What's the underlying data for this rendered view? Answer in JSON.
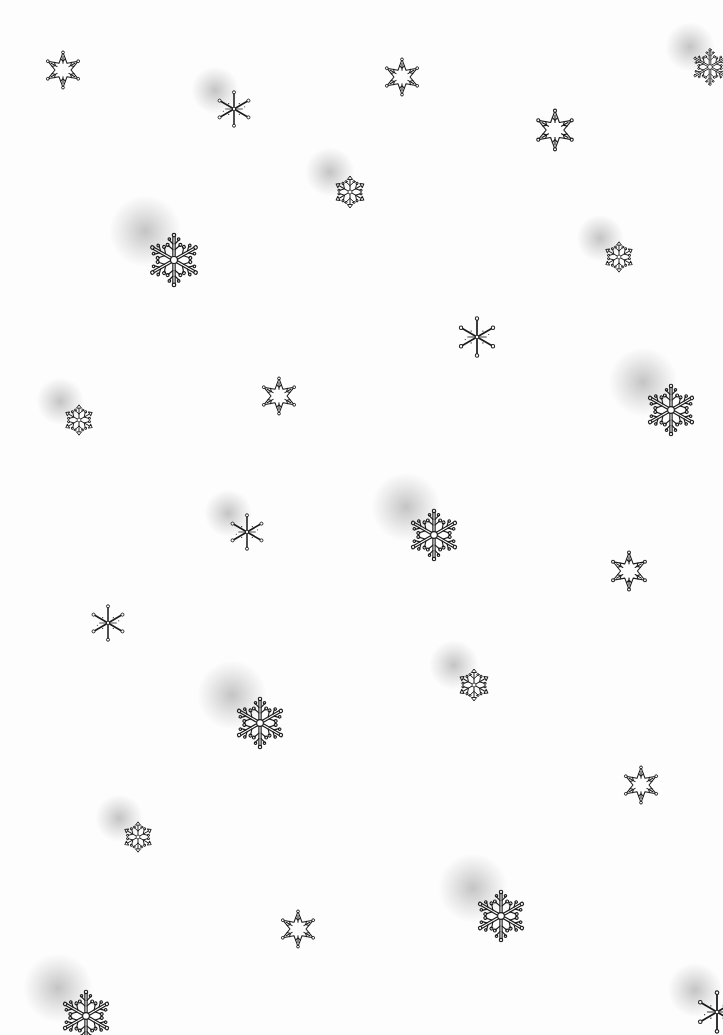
{
  "canvas": {
    "width": 698,
    "height": 1035,
    "background": "#fdfdfd",
    "ink": "#1a1a1a"
  },
  "flake_types": [
    "star-outline",
    "thin-star",
    "branched",
    "round"
  ],
  "snowflakes": [
    {
      "x": 43,
      "y": 50,
      "size": 40,
      "type": "star-outline",
      "shaded": false
    },
    {
      "x": 215,
      "y": 90,
      "size": 38,
      "type": "thin-star",
      "shaded": true
    },
    {
      "x": 382,
      "y": 57,
      "size": 40,
      "type": "star-outline",
      "shaded": false
    },
    {
      "x": 690,
      "y": 47,
      "size": 40,
      "type": "branched",
      "shaded": true
    },
    {
      "x": 533,
      "y": 108,
      "size": 44,
      "type": "star-outline",
      "shaded": false
    },
    {
      "x": 330,
      "y": 172,
      "size": 40,
      "type": "round",
      "shaded": true
    },
    {
      "x": 145,
      "y": 231,
      "size": 58,
      "type": "branched",
      "shaded": true
    },
    {
      "x": 600,
      "y": 238,
      "size": 38,
      "type": "round",
      "shaded": true
    },
    {
      "x": 456,
      "y": 316,
      "size": 42,
      "type": "thin-star",
      "shaded": false
    },
    {
      "x": 259,
      "y": 376,
      "size": 40,
      "type": "star-outline",
      "shaded": false
    },
    {
      "x": 643,
      "y": 382,
      "size": 56,
      "type": "branched",
      "shaded": true
    },
    {
      "x": 60,
      "y": 401,
      "size": 38,
      "type": "round",
      "shaded": true
    },
    {
      "x": 228,
      "y": 513,
      "size": 38,
      "type": "thin-star",
      "shaded": true
    },
    {
      "x": 406,
      "y": 507,
      "size": 56,
      "type": "branched",
      "shaded": true
    },
    {
      "x": 608,
      "y": 550,
      "size": 42,
      "type": "star-outline",
      "shaded": false
    },
    {
      "x": 89,
      "y": 604,
      "size": 38,
      "type": "thin-star",
      "shaded": false
    },
    {
      "x": 454,
      "y": 665,
      "size": 40,
      "type": "round",
      "shaded": true
    },
    {
      "x": 232,
      "y": 695,
      "size": 56,
      "type": "branched",
      "shaded": true
    },
    {
      "x": 621,
      "y": 765,
      "size": 40,
      "type": "star-outline",
      "shaded": false
    },
    {
      "x": 119,
      "y": 818,
      "size": 38,
      "type": "round",
      "shaded": true
    },
    {
      "x": 473,
      "y": 888,
      "size": 56,
      "type": "branched",
      "shaded": true
    },
    {
      "x": 278,
      "y": 909,
      "size": 40,
      "type": "star-outline",
      "shaded": false
    },
    {
      "x": 58,
      "y": 988,
      "size": 56,
      "type": "branched",
      "shaded": true
    },
    {
      "x": 695,
      "y": 990,
      "size": 44,
      "type": "thin-star",
      "shaded": true
    }
  ]
}
